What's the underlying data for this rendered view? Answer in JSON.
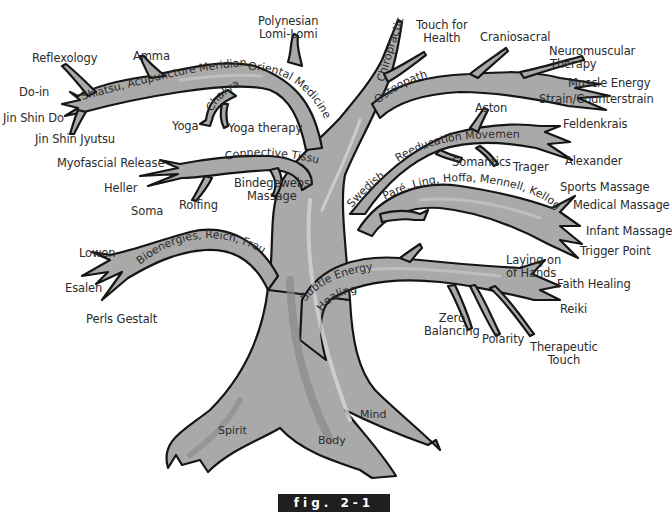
{
  "figure": {
    "caption": "fig. 2-1",
    "colors": {
      "bark": "#a9a9a9",
      "bark_dark": "#8a8a8a",
      "bark_light": "#d4d4d4",
      "outline": "#151515",
      "caption_bg": "#1f1f1f",
      "caption_text": "#ffffff"
    }
  },
  "roots": {
    "spirit": "Spirit",
    "body": "Body",
    "mind": "Mind"
  },
  "branches": {
    "oriental_medicine": "Oriental Medicine",
    "shiatsu": "Shiatsu, Acupuncture Meridians",
    "chakras": "Chakras",
    "connective_tissue": "Connective Tissue",
    "bioenergies": "Bioenergies, Reich, Freud",
    "chiropractic": "Chiropractic",
    "osteopath": "Osteopath",
    "swedish": "Swedish",
    "reeducation": "Reeducation Movement",
    "pare": "Paré, Ling, Hoffa, Mennell, Kellogg",
    "subtle_energy_1": "Subtle Energy",
    "subtle_energy_2": "Healing"
  },
  "leaves": {
    "polynesian_1": "Polynesian",
    "polynesian_2": "Lomi-Lomi",
    "reflexology": "Reflexology",
    "amma": "Amma",
    "do_in": "Do-in",
    "jin_shin_do": "Jin Shin Do",
    "jin_shin_jyutsu": "Jin Shin Jyutsu",
    "yoga": "Yoga",
    "yoga_therapy": "Yoga therapy",
    "myofascial": "Myofascial Release",
    "heller": "Heller",
    "soma": "Soma",
    "rolfing": "Rolfing",
    "bindegewebs_1": "Bindegewebs",
    "bindegewebs_2": "Massage",
    "lowen": "Lowen",
    "esalen": "Esalen",
    "perls": "Perls Gestalt",
    "touch_health_1": "Touch for",
    "touch_health_2": "Health",
    "craniosacral": "Craniosacral",
    "neuromuscular_1": "Neuromuscular",
    "neuromuscular_2": "Therapy",
    "muscle_energy": "Muscle Energy",
    "strain": "Strain/Counterstrain",
    "aston": "Aston",
    "feldenkrais": "Feldenkrais",
    "somantics": "Somantics",
    "trager": "Trager",
    "alexander": "Alexander",
    "sports": "Sports Massage",
    "medical": "Medical Massage",
    "infant": "Infant Massage",
    "trigger": "Trigger Point",
    "laying_1": "Laying on",
    "laying_2": "of Hands",
    "faith": "Faith Healing",
    "reiki": "Reiki",
    "zero_1": "Zero",
    "zero_2": "Balancing",
    "polarity": "Polarity",
    "therapeutic_1": "Therapeutic",
    "therapeutic_2": "Touch"
  }
}
